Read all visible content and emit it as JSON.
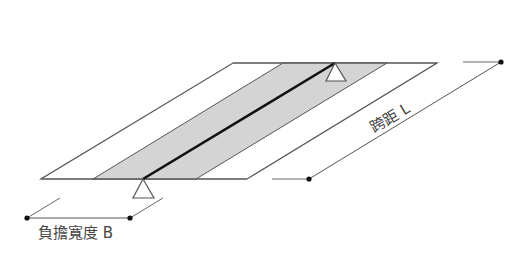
{
  "diagram": {
    "type": "one-way slab load strip (isometric)",
    "labels": {
      "span": "跨距 L",
      "width": "負擔寬度 B"
    },
    "colors": {
      "outline": "#555555",
      "strip_fill": "#d4d4d4",
      "beam": "#111111",
      "dim_line": "#555555",
      "dot": "#111111",
      "text": "#444444"
    },
    "slab": {
      "top_edge_y": 63,
      "bottom_edge_y": 179,
      "top_left_x": 233,
      "top_right_x": 437,
      "bottom_left_x": 41,
      "bottom_right_x": 247
    },
    "strip": {
      "top_left_x": 283,
      "top_right_x": 387,
      "bottom_left_x": 93,
      "bottom_right_x": 196
    },
    "beam": {
      "top": [
        335,
        63
      ],
      "bottom": [
        143,
        179
      ]
    },
    "supports": [
      {
        "name": "top-support",
        "apex": [
          335,
          63
        ],
        "base_left": [
          326,
          81
        ],
        "base_right": [
          346,
          81
        ]
      },
      {
        "name": "bottom-support",
        "apex": [
          143,
          179
        ],
        "base_left": [
          133,
          198
        ],
        "base_right": [
          154,
          198
        ]
      }
    ]
  }
}
